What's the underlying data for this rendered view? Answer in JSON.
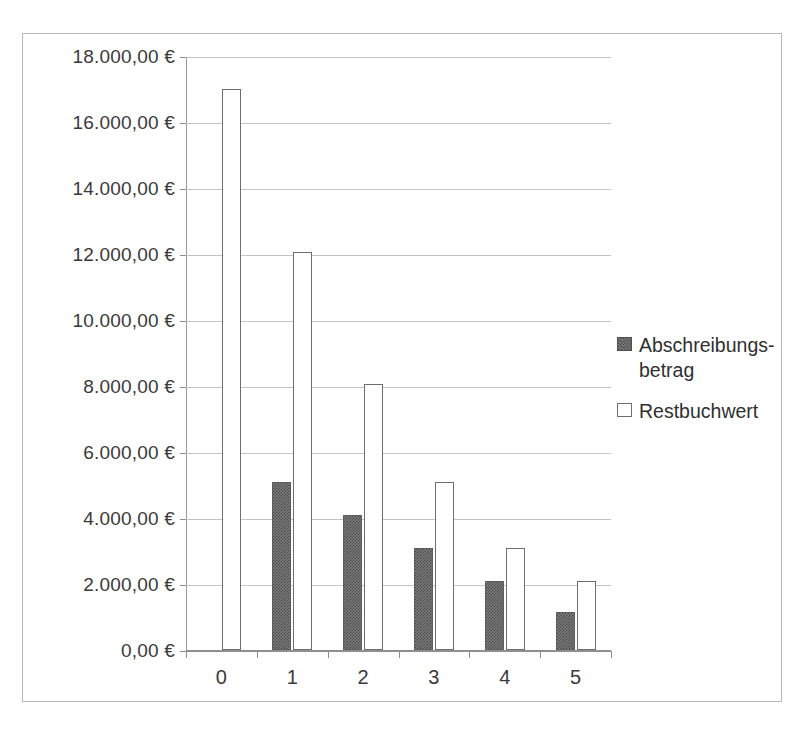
{
  "chart_data": {
    "type": "bar",
    "title": "",
    "subtitle": "",
    "xlabel": "",
    "ylabel": "",
    "categories": [
      "0",
      "1",
      "2",
      "3",
      "4",
      "5"
    ],
    "series": [
      {
        "name": "Abschreibungs-\nbetrag",
        "style": "dark-hatched",
        "values": [
          0,
          5100,
          4100,
          3100,
          2100,
          1150
        ]
      },
      {
        "name": "Restbuchwert",
        "style": "white-outline",
        "values": [
          17000,
          12050,
          8050,
          5100,
          3100,
          2100
        ]
      }
    ],
    "ylim": [
      0,
      18000
    ],
    "ytick_values": [
      0,
      2000,
      4000,
      6000,
      8000,
      10000,
      12000,
      14000,
      16000,
      18000
    ],
    "ytick_labels": [
      "0,00 €",
      "2.000,00 €",
      "4.000,00 €",
      "6.000,00 €",
      "8.000,00 €",
      "10.000,00 €",
      "12.000,00 €",
      "14.000,00 €",
      "16.000,00 €",
      "18.000,00 €"
    ],
    "grid": true,
    "legend_position": "right",
    "legend_entries": [
      "Abschreibungs-\nbetrag",
      "Restbuchwert"
    ],
    "colors": {
      "series_dark": "#7c7c7c",
      "series_light": "#ffffff",
      "gridline": "#c4c4c4",
      "axis": "#8f8f8f",
      "border": "#b9b9b9",
      "text": "#3a3a3a",
      "background": "#ffffff"
    }
  }
}
